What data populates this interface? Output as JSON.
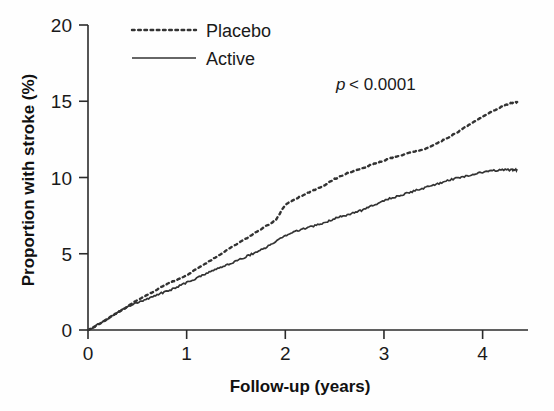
{
  "figure": {
    "background_color": "#fefefe",
    "ink_color": "#333333"
  },
  "annotation": {
    "p_symbol": "p",
    "p_text": "< 0.0001",
    "full_text": "p < 0.0001"
  },
  "axes": {
    "x_title": "Follow-up (years)",
    "y_title": "Proportion with stroke (%)",
    "x_ticks": [
      "0",
      "1",
      "2",
      "3",
      "4"
    ],
    "y_ticks": [
      "0",
      "5",
      "10",
      "15",
      "20"
    ]
  },
  "legend": {
    "entries": [
      {
        "label": "Placebo",
        "style": "dotted"
      },
      {
        "label": "Active",
        "style": "solid"
      }
    ]
  },
  "chart_data": {
    "type": "line",
    "title": "",
    "xlabel": "Follow-up (years)",
    "ylabel": "Proportion with stroke (%)",
    "xlim": [
      0,
      4.35
    ],
    "ylim": [
      0,
      20
    ],
    "xticks": [
      0,
      1,
      2,
      3,
      4
    ],
    "yticks": [
      0,
      5,
      10,
      15,
      20
    ],
    "grid": false,
    "legend_position": "top-center",
    "annotations": [
      {
        "text": "p < 0.0001",
        "x": 3.0,
        "y": 16.6
      }
    ],
    "series": [
      {
        "name": "Placebo",
        "style": "dotted",
        "x": [
          0.0,
          0.1,
          0.2,
          0.3,
          0.4,
          0.5,
          0.6,
          0.7,
          0.8,
          0.9,
          1.0,
          1.1,
          1.2,
          1.3,
          1.4,
          1.5,
          1.6,
          1.7,
          1.8,
          1.9,
          2.0,
          2.1,
          2.2,
          2.3,
          2.4,
          2.5,
          2.6,
          2.7,
          2.8,
          2.9,
          3.0,
          3.1,
          3.2,
          3.3,
          3.4,
          3.5,
          3.6,
          3.7,
          3.8,
          3.9,
          4.0,
          4.1,
          4.2,
          4.3,
          4.35
        ],
        "y": [
          0.0,
          0.35,
          0.75,
          1.15,
          1.55,
          1.95,
          2.3,
          2.65,
          3.0,
          3.3,
          3.6,
          4.0,
          4.4,
          4.8,
          5.2,
          5.6,
          6.0,
          6.4,
          6.8,
          7.2,
          8.2,
          8.6,
          8.9,
          9.2,
          9.5,
          9.9,
          10.2,
          10.45,
          10.65,
          10.9,
          11.1,
          11.35,
          11.5,
          11.7,
          11.85,
          12.1,
          12.45,
          12.8,
          13.2,
          13.6,
          14.0,
          14.35,
          14.65,
          14.9,
          14.95
        ]
      },
      {
        "name": "Active",
        "style": "solid",
        "x": [
          0.0,
          0.1,
          0.2,
          0.3,
          0.4,
          0.5,
          0.6,
          0.7,
          0.8,
          0.9,
          1.0,
          1.1,
          1.2,
          1.3,
          1.4,
          1.5,
          1.6,
          1.7,
          1.8,
          1.9,
          2.0,
          2.1,
          2.2,
          2.3,
          2.4,
          2.5,
          2.6,
          2.7,
          2.8,
          2.9,
          3.0,
          3.1,
          3.2,
          3.3,
          3.4,
          3.5,
          3.6,
          3.7,
          3.8,
          3.9,
          4.0,
          4.1,
          4.2,
          4.3,
          4.35
        ],
        "y": [
          0.0,
          0.35,
          0.75,
          1.15,
          1.5,
          1.8,
          2.05,
          2.3,
          2.55,
          2.8,
          3.1,
          3.4,
          3.7,
          4.0,
          4.25,
          4.5,
          4.8,
          5.1,
          5.4,
          5.8,
          6.2,
          6.45,
          6.65,
          6.85,
          7.05,
          7.3,
          7.5,
          7.7,
          7.9,
          8.2,
          8.5,
          8.7,
          8.9,
          9.1,
          9.3,
          9.5,
          9.7,
          9.9,
          10.05,
          10.2,
          10.35,
          10.45,
          10.5,
          10.5,
          10.5
        ]
      }
    ]
  }
}
